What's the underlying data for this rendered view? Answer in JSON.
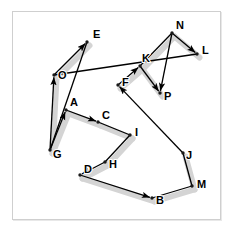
{
  "figure": {
    "title": "",
    "background_color": "#ffffff",
    "frame_color": "#cfcfcf",
    "edge_color": "#000000",
    "halo_color": "#d4d4d4",
    "label_color": "#000000"
  },
  "chart_data": {
    "type": "scatter",
    "title": "",
    "xlabel": "",
    "ylabel": "",
    "grid": false,
    "legend": "none",
    "xlim": [
      0,
      233
    ],
    "ylim": [
      231,
      0
    ],
    "nodes": [
      {
        "label": "E",
        "x": 87,
        "y": 42,
        "label_dx": 6,
        "label_dy": -4
      },
      {
        "label": "O",
        "x": 54,
        "y": 75,
        "label_dx": 4,
        "label_dy": 4
      },
      {
        "label": "N",
        "x": 172,
        "y": 33,
        "label_dx": 4,
        "label_dy": -4
      },
      {
        "label": "L",
        "x": 197,
        "y": 54,
        "label_dx": 5,
        "label_dy": 0
      },
      {
        "label": "K",
        "x": 140,
        "y": 66,
        "label_dx": 2,
        "label_dy": -4
      },
      {
        "label": "F",
        "x": 118,
        "y": 85,
        "label_dx": 4,
        "label_dy": 1
      },
      {
        "label": "P",
        "x": 160,
        "y": 93,
        "label_dx": 4,
        "label_dy": 7
      },
      {
        "label": "A",
        "x": 66,
        "y": 110,
        "label_dx": 0,
        "label_dy": -4
      },
      {
        "label": "C",
        "x": 98,
        "y": 122,
        "label_dx": 4,
        "label_dy": -3
      },
      {
        "label": "I",
        "x": 130,
        "y": 135,
        "label_dx": 5,
        "label_dy": 1
      },
      {
        "label": "G",
        "x": 50,
        "y": 150,
        "label_dx": 3,
        "label_dy": 8
      },
      {
        "label": "H",
        "x": 105,
        "y": 162,
        "label_dx": 4,
        "label_dy": 6
      },
      {
        "label": "D",
        "x": 80,
        "y": 175,
        "label_dx": 4,
        "label_dy": -2
      },
      {
        "label": "J",
        "x": 183,
        "y": 153,
        "label_dx": 3,
        "label_dy": 6
      },
      {
        "label": "M",
        "x": 192,
        "y": 186,
        "label_dx": 5,
        "label_dy": 2
      },
      {
        "label": "B",
        "x": 152,
        "y": 198,
        "label_dx": 4,
        "label_dy": 6
      }
    ],
    "edges": [
      {
        "from": "O",
        "to": "E",
        "arrow": true,
        "halo": true
      },
      {
        "from": "E",
        "to": "G",
        "arrow": false,
        "halo": false
      },
      {
        "from": "G",
        "to": "O",
        "arrow": true,
        "halo": true
      },
      {
        "from": "O",
        "to": "L",
        "arrow": false,
        "halo": false
      },
      {
        "from": "G",
        "to": "A",
        "arrow": true,
        "halo": true
      },
      {
        "from": "A",
        "to": "C",
        "arrow": true,
        "halo": true
      },
      {
        "from": "C",
        "to": "I",
        "arrow": false,
        "halo": true
      },
      {
        "from": "I",
        "to": "H",
        "arrow": false,
        "halo": true
      },
      {
        "from": "H",
        "to": "D",
        "arrow": true,
        "halo": true
      },
      {
        "from": "D",
        "to": "B",
        "arrow": true,
        "halo": true
      },
      {
        "from": "B",
        "to": "M",
        "arrow": false,
        "halo": true
      },
      {
        "from": "M",
        "to": "J",
        "arrow": false,
        "halo": true
      },
      {
        "from": "J",
        "to": "F",
        "arrow": true,
        "halo": false
      },
      {
        "from": "F",
        "to": "K",
        "arrow": true,
        "halo": true
      },
      {
        "from": "K",
        "to": "N",
        "arrow": false,
        "halo": true
      },
      {
        "from": "N",
        "to": "L",
        "arrow": true,
        "halo": true
      },
      {
        "from": "N",
        "to": "P",
        "arrow": true,
        "halo": false
      },
      {
        "from": "K",
        "to": "P",
        "arrow": true,
        "halo": true
      }
    ]
  }
}
